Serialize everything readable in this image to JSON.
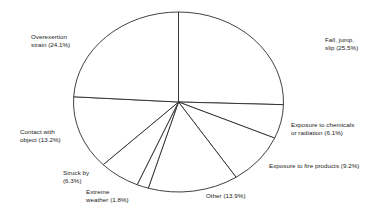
{
  "chart_data": {
    "type": "pie",
    "title": "",
    "xlabel": "",
    "ylabel": "",
    "legend_position": "outside-callout-labels",
    "grid": false,
    "start_angle_deg": 0,
    "direction": "clockwise",
    "total_percent": 100.1,
    "categories": [
      "Fall, jump, slip",
      "Exposure to chemicals or radiation",
      "Exposure to fire products",
      "Other",
      "Extreme weather",
      "Struck by",
      "Contact with object",
      "Overexertion strain"
    ],
    "values": [
      25.5,
      6.1,
      9.2,
      13.9,
      1.8,
      6.3,
      13.2,
      24.1
    ],
    "slices": [
      {
        "name": "fall-jump-slip",
        "label_lines": [
          "Fall, jump,",
          "slip (25.5%)"
        ],
        "value": 25.5,
        "label_x": 325,
        "label_y": 36,
        "align": "left"
      },
      {
        "name": "exposure-chemicals-radiation",
        "label_lines": [
          "Exposure to chemicals",
          "or radiation (6.1%)"
        ],
        "value": 6.1,
        "label_x": 291,
        "label_y": 121,
        "align": "left"
      },
      {
        "name": "exposure-fire-products",
        "label_lines": [
          "Exposure to fire products (9.2%)"
        ],
        "value": 9.2,
        "label_x": 269,
        "label_y": 162,
        "align": "left"
      },
      {
        "name": "other",
        "label_lines": [
          "Other (13.9%)"
        ],
        "value": 13.9,
        "label_x": 206,
        "label_y": 192,
        "align": "left"
      },
      {
        "name": "extreme-weather",
        "label_lines": [
          "Extreme",
          "weather (1.8%)"
        ],
        "value": 1.8,
        "label_x": 86,
        "label_y": 188,
        "align": "left"
      },
      {
        "name": "struck-by",
        "label_lines": [
          "Struck by",
          "(6.3%)"
        ],
        "value": 6.3,
        "label_x": 63,
        "label_y": 169,
        "align": "left"
      },
      {
        "name": "contact-with-object",
        "label_lines": [
          "Contact with",
          "object (13.2%)"
        ],
        "value": 13.2,
        "label_x": 20,
        "label_y": 128,
        "align": "left"
      },
      {
        "name": "overexertion-strain",
        "label_lines": [
          "Overexertion",
          "strain (24.1%)"
        ],
        "value": 24.1,
        "label_x": 31,
        "label_y": 33,
        "align": "left"
      }
    ],
    "geometry": {
      "center_x": 178.5,
      "center_y": 102,
      "radius_x": 105,
      "radius_y": 90
    },
    "colors": {
      "slice_fill": "#ffffff",
      "slice_stroke": "#2b2b2b",
      "text": "#1a1a1a",
      "background": "#ffffff"
    }
  }
}
